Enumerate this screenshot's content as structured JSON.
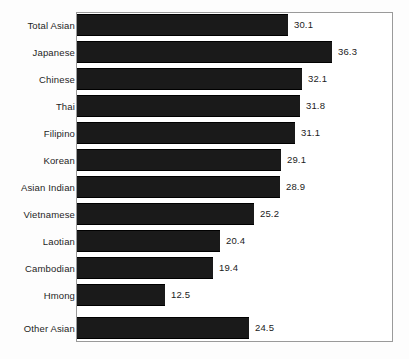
{
  "chart_data": {
    "type": "bar",
    "orientation": "horizontal",
    "title": "",
    "subtitle": "",
    "xlabel": "",
    "ylabel": "",
    "grid": false,
    "legend": null,
    "axis": {
      "x_range": [
        0,
        38
      ],
      "x_ticks_visible": false,
      "y_ticks_visible": false
    },
    "value_labels": true,
    "categories": [
      "Total Asian",
      "Japanese",
      "Chinese",
      "Thai",
      "Filipino",
      "Korean",
      "Asian Indian",
      "Vietnamese",
      "Laotian",
      "Cambodian",
      "Hmong",
      "Other Asian"
    ],
    "values": [
      30.1,
      36.3,
      32.1,
      31.8,
      31.1,
      29.1,
      28.9,
      25.2,
      20.4,
      19.4,
      12.5,
      24.5
    ],
    "labels": [
      "30.1",
      "36.3",
      "32.1",
      "31.8",
      "31.1",
      "29.1",
      "28.9",
      "25.2",
      "20.4",
      "19.4",
      "12.5",
      "24.5"
    ],
    "bar_color": "#1a1a1a",
    "frame_color": "#9a9a9a",
    "separator_before_index": 11
  }
}
